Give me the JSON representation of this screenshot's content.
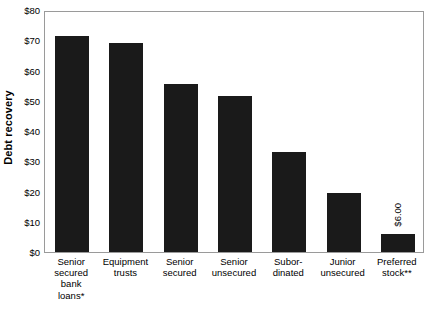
{
  "chart_data": {
    "type": "bar",
    "title": "",
    "subtitle": "",
    "xlabel": "",
    "ylabel": "Debt recovery",
    "ylim": [
      0,
      80
    ],
    "ytick_values": [
      0,
      10,
      20,
      30,
      40,
      50,
      60,
      70,
      80
    ],
    "ytick_labels": [
      "$0",
      "$10",
      "$20",
      "$30",
      "$40",
      "$50",
      "$60",
      "$70",
      "$80"
    ],
    "grid": false,
    "legend": null,
    "bar_color": "#1a1a1a",
    "plot_border_color": "#9a9a9a",
    "categories": [
      "Senior\nsecured\nbank\nloans*",
      "Equipment\ntrusts",
      "Senior\nsecured",
      "Senior\nunsecured",
      "Subor-\ndinated",
      "Junior\nunsecured",
      "Preferred\nstock**"
    ],
    "values": [
      71.5,
      69.0,
      55.5,
      51.5,
      33.0,
      19.5,
      6.0
    ],
    "data_labels": [
      "",
      "",
      "",
      "",
      "",
      "",
      "$6.00"
    ],
    "annotations": [
      {
        "text": "$6.00",
        "category": "Preferred\nstock**",
        "value": 6.0,
        "rotation": 90,
        "position": "above-bar"
      }
    ],
    "footnotes": [
      "*",
      "**"
    ]
  }
}
